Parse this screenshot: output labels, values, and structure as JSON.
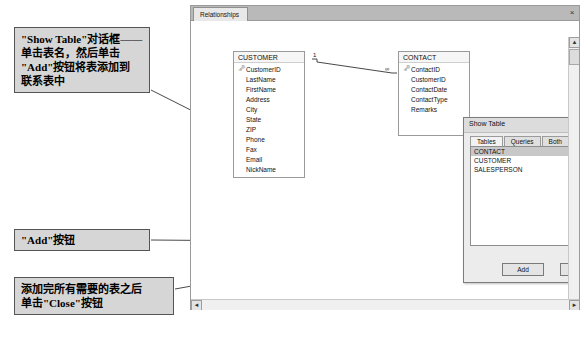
{
  "annotations": {
    "show_table_note": "\"Show Table\"对话框——\n单击表名，然后单击\n\"Add\"按钮将表添加到\n联系表中",
    "add_button_note": "\"Add\"按钮",
    "close_button_note": "添加完所有需要的表之后\n单击\"Close\"按钮"
  },
  "access_window": {
    "tab_label": "Relationships",
    "close_label": "×",
    "vscroll": {
      "up": "▲",
      "down": "▼"
    },
    "hscroll": {
      "left": "◄",
      "right": "►"
    }
  },
  "tables": [
    {
      "name": "CUSTOMER",
      "fields": [
        "CustomerID",
        "LastName",
        "FirstName",
        "Address",
        "City",
        "State",
        "ZIP",
        "Phone",
        "Fax",
        "Email",
        "NickName"
      ],
      "primary_key": "CustomerID"
    },
    {
      "name": "CONTACT",
      "fields": [
        "ContactID",
        "CustomerID",
        "ContactDate",
        "ContactType",
        "Remarks"
      ],
      "primary_key": "ContactID"
    }
  ],
  "relationship": {
    "one_label": "1",
    "many_label": "∞"
  },
  "show_table_dialog": {
    "title": "Show Table",
    "help_button": "?",
    "close_button": "×",
    "tabs": [
      {
        "label": "Tables",
        "active": true
      },
      {
        "label": "Queries",
        "active": false
      },
      {
        "label": "Both",
        "active": false
      }
    ],
    "list_items": [
      {
        "label": "CONTACT",
        "selected": true
      },
      {
        "label": "CUSTOMER",
        "selected": false
      },
      {
        "label": "SALESPERSON",
        "selected": false
      }
    ],
    "buttons": {
      "add": "Add",
      "close": "Close"
    }
  }
}
